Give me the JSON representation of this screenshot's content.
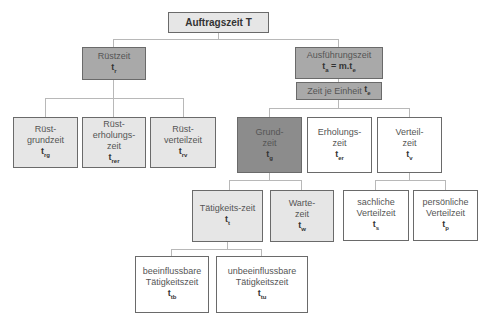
{
  "diagram": {
    "root": {
      "label": "Auftragszeit T"
    },
    "ruestzeit": {
      "label": "Rüstzeit",
      "symbol": "t",
      "sub": "r"
    },
    "ausfuehrungszeit": {
      "label": "Ausführungszeit",
      "symbol": "t",
      "sub": "a",
      "formula_mid": " = m.t",
      "formula_sub": "e"
    },
    "zeit_je_einheit": {
      "label": "Zeit je Einheit ",
      "symbol": "t",
      "sub": "e"
    },
    "ruest_grundzeit": {
      "line1": "Rüst-",
      "line2": "grundzeit",
      "symbol": "t",
      "sub": "rg"
    },
    "ruest_erholungszeit": {
      "line1": "Rüst-",
      "line2": "erholungs-",
      "line3": "zeit",
      "symbol": "t",
      "sub": "rer"
    },
    "ruest_verteilzeit": {
      "line1": "Rüst-",
      "line2": "verteilzeit",
      "symbol": "t",
      "sub": "rv"
    },
    "grundzeit": {
      "line1": "Grund-",
      "line2": "zeit",
      "symbol": "t",
      "sub": "g"
    },
    "erholungszeit": {
      "line1": "Erholungs-",
      "line2": "zeit",
      "symbol": "t",
      "sub": "er"
    },
    "verteilzeit": {
      "line1": "Verteil-",
      "line2": "zeit",
      "symbol": "t",
      "sub": "v"
    },
    "taetigkeitszeit": {
      "line1": "Tätigkeits-zeit",
      "symbol": "t",
      "sub": "t"
    },
    "wartezeit": {
      "line1": "Warte-",
      "line2": "zeit",
      "symbol": "t",
      "sub": "w"
    },
    "sachliche_verteilzeit": {
      "line1": "sachliche",
      "line2": "Verteilzeit",
      "symbol": "t",
      "sub": "s"
    },
    "persoenliche_verteilzeit": {
      "line1": "persönliche",
      "line2": "Verteilzeit",
      "symbol": "t",
      "sub": "p"
    },
    "beeinflussbare": {
      "line1": "beeinflussbare",
      "line2": "Tätigkeitszeit",
      "symbol": "t",
      "sub": "tb"
    },
    "unbeeinflussbare": {
      "line1": "unbeeinflussbare",
      "line2": "Tätigkeitszeit",
      "symbol": "t",
      "sub": "tu"
    }
  },
  "colors": {
    "light_fill": "#e6e6e6",
    "medium_fill": "#a9a9a9",
    "dark_fill": "#8c8c8c",
    "white_fill": "#ffffff",
    "border": "#6a6a6a",
    "connector": "#b8b8b8"
  }
}
